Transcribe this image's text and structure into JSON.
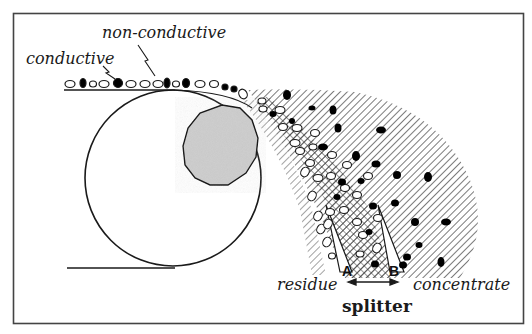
{
  "diagram": {
    "labels": {
      "conductive": "conductive",
      "non_conductive": "non-conductive",
      "residue": "residue",
      "concentrate": "concentrate",
      "splitter": "splitter",
      "point_a": "A",
      "point_b": "B"
    },
    "components": [
      {
        "id": "drum",
        "description": "large rotating drum (outlined circle)"
      },
      {
        "id": "electrode",
        "description": "grey polygonal electrode inside drum (upper right)"
      },
      {
        "id": "feed-belt",
        "description": "horizontal feed line on top carrying mixed particles"
      },
      {
        "id": "base-line",
        "description": "horizontal ground line at bottom of drum"
      },
      {
        "id": "concentrate-fan",
        "description": "hatched trajectory region for conductive particles (black)"
      },
      {
        "id": "middlings-band",
        "description": "cross-hatched band between A and B"
      },
      {
        "id": "residue-stream",
        "description": "non-conductive particles (white ovals) falling close to drum"
      },
      {
        "id": "splitter-arrow",
        "description": "double-headed arrow between A and B"
      }
    ],
    "colors": {
      "stroke": "#1a1a1a",
      "electrode_fill": "#cfcfcf",
      "background": "#ffffff",
      "conductive_particle": "#000000",
      "non_conductive_particle": "#ffffff"
    }
  }
}
